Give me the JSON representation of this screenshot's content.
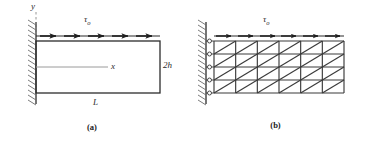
{
  "figure": {
    "panels": [
      {
        "id": "a",
        "caption": "(a)",
        "type": "continuum-model",
        "labels": {
          "y_axis": "y",
          "x_axis": "x",
          "height": "2h",
          "length": "L",
          "traction_symbol": "τ",
          "traction_subscript": "o"
        },
        "geometry": {
          "rect_left_px": 36,
          "rect_top_px": 41,
          "rect_right_px": 160,
          "rect_bottom_px": 93,
          "wall_x_px": 36,
          "wall_top_px": 22,
          "wall_bottom_px": 104,
          "neutral_axis_y_px": 67
        },
        "load": {
          "symbol": "tau-o",
          "description": "uniform shear traction on top surface",
          "direction": "rightward",
          "arrow_count": 5,
          "arrow_row_y_px": 36
        },
        "support": {
          "type": "fixed-wall",
          "hatching": "diagonal",
          "side": "left"
        }
      },
      {
        "id": "b",
        "caption": "(b)",
        "type": "finite-element-mesh",
        "labels": {
          "traction_symbol": "τ",
          "traction_subscript": "o"
        },
        "mesh": {
          "columns": 6,
          "rows": 4,
          "element_shape": "triangle",
          "diagonal_direction": "bottom-left-to-top-right",
          "triangle_count": 48,
          "node_columns": 7,
          "node_rows": 5,
          "mesh_left_px": 30,
          "mesh_top_px": 41,
          "mesh_right_px": 160,
          "mesh_bottom_px": 93
        },
        "load": {
          "symbol": "tau-o",
          "description": "uniform shear traction on top edge",
          "direction": "rightward",
          "arrow_count": 6,
          "arrow_row_y_px": 36
        },
        "support": {
          "type": "fixed-wall-with-nodes",
          "hatching": "diagonal",
          "side": "left",
          "constrained_node_count": 5
        }
      }
    ],
    "colors": {
      "line": "#2b2b2b",
      "mesh_line": "#3a3a3a",
      "light_line": "#8a8a8a",
      "hatch": "#6b6b6b",
      "background": "#ffffff",
      "text": "#1a1a1a"
    }
  }
}
